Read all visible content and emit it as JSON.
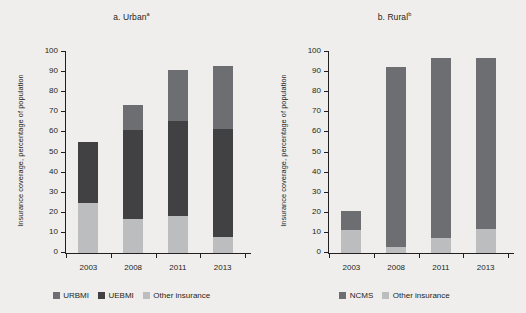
{
  "figure": {
    "background": "#efeeec",
    "axis_color": "#231f20"
  },
  "colors": {
    "urbmi": "#6d6e71",
    "uebmi": "#414042",
    "ncms": "#6d6e71",
    "other": "#bcbdbf"
  },
  "panels": [
    {
      "id": "urban",
      "title_main": "a. Urban",
      "title_sup": "a",
      "ylabel": "Insurance coverage, percentage of population",
      "legend": [
        {
          "label": "URBMI",
          "color_key": "urbmi"
        },
        {
          "label": "UEBMI",
          "color_key": "uebmi"
        },
        {
          "label": "Other insurance",
          "color_key": "other"
        }
      ]
    },
    {
      "id": "rural",
      "title_main": "b. Rural",
      "title_sup": "b",
      "ylabel": "Insurance coverage, percentage of population",
      "legend": [
        {
          "label": "NCMS",
          "color_key": "ncms"
        },
        {
          "label": "Other insurance",
          "color_key": "other"
        }
      ]
    }
  ],
  "chart_data": [
    {
      "type": "bar",
      "subtype": "stacked",
      "title": "a. Urban",
      "xlabel": "",
      "ylabel": "Insurance coverage, percentage of population",
      "ylim": [
        0,
        100
      ],
      "yticks": [
        0,
        10,
        20,
        30,
        40,
        50,
        60,
        70,
        80,
        90,
        100
      ],
      "ytick_labels": [
        "0",
        "10",
        "20",
        "30",
        "40",
        "50",
        "60",
        "70",
        "80",
        "90",
        "100"
      ],
      "grid": false,
      "legend_position": "bottom",
      "categories": [
        "2003",
        "2008",
        "2011",
        "2013"
      ],
      "series": [
        {
          "name": "Other insurance",
          "color": "#bcbdbf",
          "values": [
            24.8,
            17.0,
            18.6,
            8.0
          ]
        },
        {
          "name": "UEBMI",
          "color": "#414042",
          "values": [
            30.6,
            44.2,
            47.2,
            53.8
          ]
        },
        {
          "name": "URBMI",
          "color": "#6d6e71",
          "values": [
            0.0,
            12.3,
            25.2,
            31.2
          ]
        }
      ],
      "totals": [
        55.4,
        73.5,
        91.0,
        93.0
      ]
    },
    {
      "type": "bar",
      "subtype": "stacked",
      "title": "b. Rural",
      "xlabel": "",
      "ylabel": "Insurance coverage, percentage of population",
      "ylim": [
        0,
        100
      ],
      "yticks": [
        0,
        10,
        20,
        30,
        40,
        50,
        60,
        70,
        80,
        90,
        100
      ],
      "ytick_labels": [
        "0",
        "10",
        "20",
        "30",
        "40",
        "50",
        "60",
        "70",
        "80",
        "90",
        "100"
      ],
      "grid": false,
      "legend_position": "bottom",
      "categories": [
        "2003",
        "2008",
        "2011",
        "2013"
      ],
      "series": [
        {
          "name": "Other insurance",
          "color": "#bcbdbf",
          "values": [
            11.5,
            2.8,
            7.6,
            11.8
          ]
        },
        {
          "name": "NCMS",
          "color": "#6d6e71",
          "values": [
            9.5,
            89.7,
            89.4,
            85.2
          ]
        }
      ],
      "totals": [
        21.0,
        92.5,
        97.0,
        97.0
      ]
    }
  ]
}
